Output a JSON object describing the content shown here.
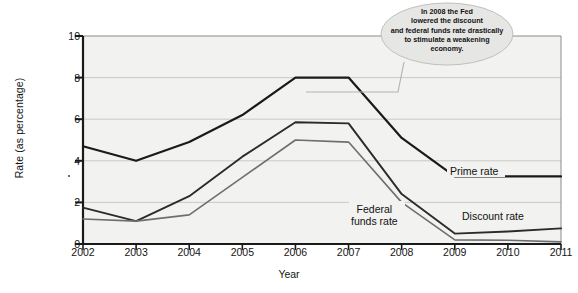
{
  "chart_data": {
    "type": "line",
    "title": "",
    "xlabel": "Year",
    "ylabel": "Rate (as percentage)",
    "categories": [
      "2002",
      "2003",
      "2004",
      "2005",
      "2006",
      "2007",
      "2008",
      "2009",
      "2010",
      "2011"
    ],
    "x": [
      2002,
      2003,
      2004,
      2005,
      2006,
      2007,
      2008,
      2009,
      2010,
      2011
    ],
    "xlim": [
      2002,
      2011
    ],
    "ylim": [
      0,
      10
    ],
    "yticks": [
      0,
      2,
      4,
      6,
      8,
      10
    ],
    "grid": true,
    "legend_position": "inline-labels",
    "series": [
      {
        "name": "Prime rate",
        "color": "#1a1a1a",
        "values": [
          4.7,
          4.0,
          4.9,
          6.2,
          8.0,
          8.0,
          5.1,
          3.25,
          3.25,
          3.25
        ]
      },
      {
        "name": "Discount rate",
        "color": "#2b2b2b",
        "values": [
          1.75,
          1.1,
          2.3,
          4.2,
          5.85,
          5.8,
          2.4,
          0.5,
          0.6,
          0.75
        ]
      },
      {
        "name": "Federal funds rate",
        "color": "#6e6e6e",
        "values": [
          1.2,
          1.1,
          1.4,
          3.2,
          5.0,
          4.9,
          2.0,
          0.2,
          0.18,
          0.1
        ]
      }
    ],
    "annotations": [
      {
        "name": "fed-2008-callout",
        "text": "In 2008 the Fed lowered the discount and federal funds rate drastically to stimulate a weakening economy.",
        "points_to_x": 2007.6
      }
    ]
  },
  "axes": {
    "y_title": "Rate (as percentage)",
    "x_title": "Year",
    "y_tick_labels": [
      "0",
      "2",
      "4",
      "6",
      "8",
      "10"
    ],
    "x_tick_labels": [
      "2002",
      "2003",
      "2004",
      "2005",
      "2006",
      "2007",
      "2008",
      "2009",
      "2010",
      "2011"
    ]
  },
  "labels": {
    "prime": "Prime rate",
    "discount": "Discount rate",
    "federal_funds": "Federal\nfunds rate"
  },
  "callout": {
    "line1": "In 2008 the Fed",
    "line2": "lowered the discount",
    "line3": "and federal funds rate drastically",
    "line4": "to stimulate a weakening",
    "line5": "economy.",
    "full_text": "In 2008 the Fed lowered the discount and federal funds rate drastically to stimulate a weakening economy."
  },
  "colors": {
    "plot_background": "#f2f2f0",
    "grid": "#c9c9c7",
    "axis": "#1a1a1a",
    "prime": "#1a1a1a",
    "discount": "#2b2b2b",
    "federal_funds": "#6e6e6e",
    "callout_fill": "#e6e6e4"
  }
}
